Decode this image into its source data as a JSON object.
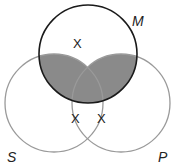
{
  "diagram": {
    "type": "venn-3",
    "circles": [
      {
        "id": "M",
        "label": "M"
      },
      {
        "id": "S",
        "label": "S"
      },
      {
        "id": "P",
        "label": "P"
      }
    ],
    "shaded_regions": [
      "M∩S",
      "M∩P"
    ],
    "x_marks": [
      {
        "region": "M only",
        "text": "X"
      },
      {
        "region": "S∩P boundary (on M)",
        "text": "X"
      },
      {
        "region": "S∩P boundary (on M)",
        "text": "X"
      }
    ],
    "colors": {
      "shade": "#8a8a8a",
      "m_stroke": "#1a1a1a",
      "sp_stroke": "#9a9a9a"
    }
  }
}
